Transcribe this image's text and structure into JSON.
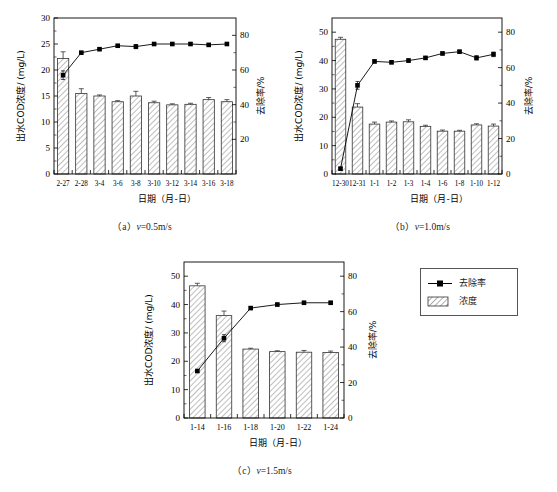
{
  "figure": {
    "axis_titles": {
      "y_left": "出水COD浓度/ (mg/L)",
      "y_right": "去除率/%",
      "x": "日期（月-日）"
    },
    "legend": {
      "title": "",
      "items": [
        {
          "label": "去除率",
          "symbol": "line-square-marker",
          "color": "#000000"
        },
        {
          "label": "浓度",
          "symbol": "hatched-bar",
          "color": "#000000"
        }
      ]
    },
    "captions": {
      "a": {
        "prefix": "（a）",
        "var": "v",
        "value": "=0.5m/s"
      },
      "b": {
        "prefix": "（b）",
        "var": "v",
        "value": "=1.0m/s"
      },
      "c": {
        "prefix": "（c）",
        "var": "v",
        "value": "=1.5m/s"
      }
    }
  },
  "chart_data": [
    {
      "id": "panel-a",
      "type": "bar",
      "title": "（a）v=0.5m/s",
      "xlabel": "日期（月-日）",
      "ylabel": "出水COD浓度/ (mg/L)",
      "y2label": "去除率/%",
      "categories": [
        "2-27",
        "2-28",
        "3-4",
        "3-6",
        "3-8",
        "3-10",
        "3-12",
        "3-14",
        "3-16",
        "3-18"
      ],
      "ylim": [
        0,
        30
      ],
      "yticks": [
        0,
        5,
        10,
        15,
        20,
        25,
        30
      ],
      "y2lim": [
        0,
        90
      ],
      "y2ticks": [
        20,
        40,
        60,
        80
      ],
      "grid": false,
      "legend_position": "outside-right",
      "series": [
        {
          "name": "浓度",
          "kind": "bar",
          "axis": "left",
          "values": [
            22.2,
            15.5,
            15.0,
            13.9,
            15.0,
            13.7,
            13.3,
            13.4,
            14.3,
            13.9
          ],
          "errors": [
            1.3,
            0.9,
            0.2,
            0.2,
            0.9,
            0.3,
            0.2,
            0.2,
            0.4,
            0.4
          ]
        },
        {
          "name": "去除率",
          "kind": "line",
          "axis": "right",
          "values": [
            57.0,
            70.0,
            72.0,
            74.0,
            73.5,
            75.0,
            75.0,
            75.0,
            74.5,
            75.0
          ],
          "errors": [
            2.5,
            0.6,
            0.5,
            0.5,
            1.2,
            0.5,
            0.5,
            0.5,
            0.5,
            0.5
          ]
        }
      ]
    },
    {
      "id": "panel-b",
      "type": "bar",
      "title": "（b）v=1.0m/s",
      "xlabel": "日期（月-日）",
      "ylabel": "出水COD浓度/ (mg/L)",
      "y2label": "去除率/%",
      "categories": [
        "12-30",
        "12-31",
        "1-1",
        "1-2",
        "1-3",
        "1-4",
        "1-6",
        "1-8",
        "1-10",
        "1-12"
      ],
      "ylim": [
        0,
        55
      ],
      "yticks": [
        0,
        10,
        20,
        30,
        40,
        50
      ],
      "y2lim": [
        0,
        88
      ],
      "y2ticks": [
        0,
        20,
        40,
        60,
        80
      ],
      "grid": false,
      "legend_position": "outside-right",
      "series": [
        {
          "name": "浓度",
          "kind": "bar",
          "axis": "left",
          "values": [
            47.5,
            23.6,
            17.6,
            18.3,
            18.4,
            16.8,
            15.1,
            15.1,
            17.3,
            16.9
          ],
          "errors": [
            0.7,
            1.2,
            0.7,
            0.4,
            0.7,
            0.4,
            0.4,
            0.3,
            0.4,
            0.7
          ]
        },
        {
          "name": "去除率",
          "kind": "line",
          "axis": "right",
          "values": [
            3.0,
            50.0,
            63.5,
            63.0,
            64.0,
            65.5,
            68.0,
            69.0,
            65.5,
            67.5
          ],
          "errors": [
            0.8,
            2.2,
            0.8,
            0.8,
            1.0,
            0.8,
            0.8,
            0.8,
            1.2,
            1.3
          ]
        }
      ]
    },
    {
      "id": "panel-c",
      "type": "bar",
      "title": "（c）v=1.5m/s",
      "xlabel": "日期（月-日）",
      "ylabel": "出水COD浓度/ (mg/L)",
      "y2label": "去除率/%",
      "categories": [
        "1-14",
        "1-16",
        "1-18",
        "1-20",
        "1-22",
        "1-24"
      ],
      "ylim": [
        0,
        55
      ],
      "yticks": [
        0,
        10,
        20,
        30,
        40,
        50
      ],
      "y2lim": [
        0,
        88
      ],
      "y2ticks": [
        0,
        20,
        40,
        60,
        80
      ],
      "grid": false,
      "legend_position": "outside-right",
      "series": [
        {
          "name": "浓度",
          "kind": "bar",
          "axis": "left",
          "values": [
            46.6,
            36.1,
            24.3,
            23.4,
            23.2,
            23.1
          ],
          "errors": [
            0.9,
            1.6,
            0.3,
            0.3,
            0.6,
            0.5
          ]
        },
        {
          "name": "去除率",
          "kind": "line",
          "axis": "right",
          "values": [
            26.5,
            45.0,
            62.0,
            64.0,
            65.0,
            65.0
          ],
          "errors": [
            0.8,
            2.0,
            0.8,
            0.8,
            0.8,
            0.8
          ]
        }
      ]
    }
  ]
}
